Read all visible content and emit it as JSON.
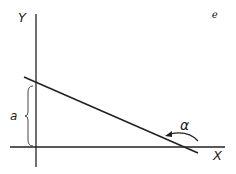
{
  "diagram": {
    "axis_labels": {
      "y": "Y",
      "x": "X"
    },
    "intercept_label": "a",
    "angle_label": "α",
    "corner_mark": "ℯ",
    "colors": {
      "stroke": "#222222",
      "background": "#ffffff"
    }
  }
}
